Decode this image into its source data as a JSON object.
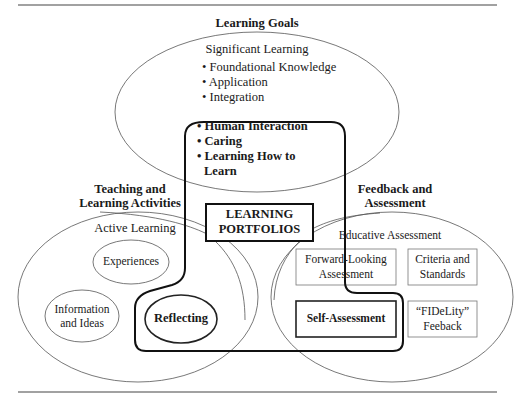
{
  "diagram": {
    "goals": {
      "heading": "Learning Goals",
      "subtitle": "Significant Learning",
      "items": [
        "• Foundational Knowledge",
        "• Application",
        "• Integration"
      ],
      "bold_items": [
        "• Human Interaction",
        "• Caring",
        "• Learning How to",
        "Learn"
      ]
    },
    "center": {
      "line1": "LEARNING",
      "line2": "PORTFOLIOS"
    },
    "teaching": {
      "heading_line1": "Teaching and",
      "heading_line2": "Learning Activities",
      "subtitle": "Active Learning",
      "experiences": "Experiences",
      "info_line1": "Information",
      "info_line2": "and Ideas",
      "reflecting": "Reflecting"
    },
    "feedback": {
      "heading_line1": "Feedback and",
      "heading_line2": "Assessment",
      "subtitle": "Educative Assessment",
      "forward_line1": "Forward-Looking",
      "forward_line2": "Assessment",
      "criteria_line1": "Criteria and",
      "criteria_line2": "Standards",
      "self": "Self-Assessment",
      "fidelity_line1": "“FIDeLity”",
      "fidelity_line2": "Feeback"
    },
    "colors": {
      "line": "#222222",
      "thin": "#555555",
      "rule": "#444444"
    }
  }
}
